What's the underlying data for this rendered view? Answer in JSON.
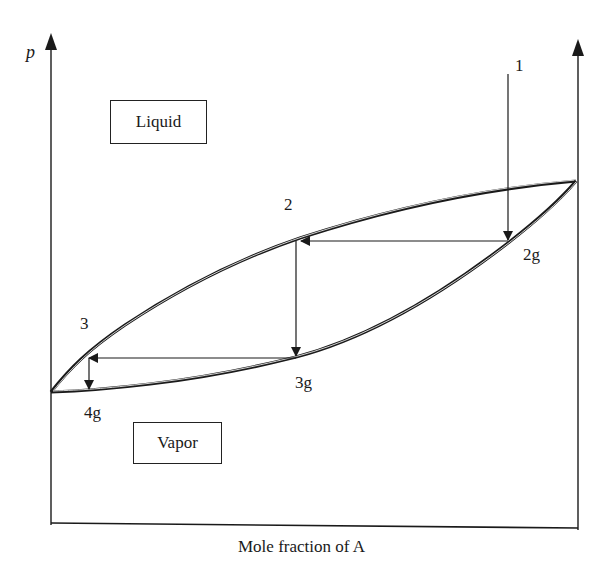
{
  "diagram": {
    "type": "phase-diagram",
    "y_axis_label": "p",
    "x_axis_label": "Mole fraction of A",
    "regions": {
      "liquid": "Liquid",
      "vapor": "Vapor"
    },
    "points": {
      "p1": "1",
      "p2": "2",
      "p2g": "2g",
      "p3": "3",
      "p3g": "3g",
      "p4g": "4g"
    },
    "curves": [
      {
        "name": "liquid-curve (upper)",
        "from": "left axis bottom",
        "to": "right axis top"
      },
      {
        "name": "vapor-curve (lower)",
        "from": "left axis bottom",
        "to": "right axis top"
      }
    ],
    "steps": [
      {
        "from": "1",
        "to": "2g",
        "direction": "down"
      },
      {
        "from": "2g",
        "to": "2",
        "direction": "left"
      },
      {
        "from": "2",
        "to": "3g",
        "direction": "down"
      },
      {
        "from": "3g",
        "to": "3",
        "direction": "left"
      },
      {
        "from": "3",
        "to": "4g",
        "direction": "down"
      }
    ],
    "colors": {
      "line": "#1a1a1a",
      "background": "#ffffff"
    }
  }
}
